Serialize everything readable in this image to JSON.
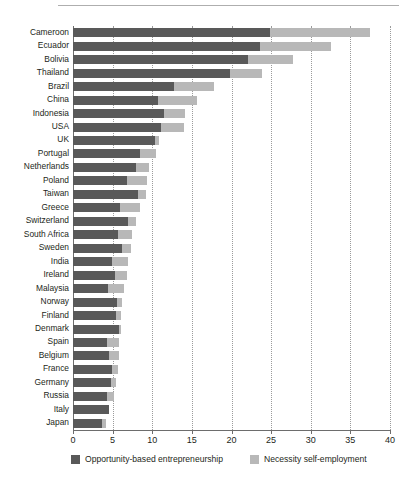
{
  "chart_data": {
    "type": "bar",
    "orientation": "horizontal",
    "stacked": true,
    "title": "",
    "subtitle": "",
    "xlabel": "",
    "ylabel": "",
    "xlim": [
      0,
      40
    ],
    "xticks": [
      0,
      5,
      10,
      15,
      20,
      25,
      30,
      35,
      40
    ],
    "xticklabels": [
      "0",
      "5",
      "10",
      "15",
      "20",
      "25",
      "30",
      "35",
      "40"
    ],
    "grid": "vertical-dotted",
    "legend_position": "bottom",
    "categories": [
      "Cameroon",
      "Ecuador",
      "Bolivia",
      "Thailand",
      "Brazil",
      "China",
      "Indonesia",
      "USA",
      "UK",
      "Portugal",
      "Netherlands",
      "Poland",
      "Taiwan",
      "Greece",
      "Switzerland",
      "South Africa",
      "Sweden",
      "India",
      "Ireland",
      "Malaysia",
      "Norway",
      "Finland",
      "Denmark",
      "Spain",
      "Belgium",
      "France",
      "Germany",
      "Russia",
      "Italy",
      "Japan"
    ],
    "series": [
      {
        "name": "Opportunity-based entrepreneurship",
        "color": "#595959",
        "values": [
          24.9,
          23.6,
          22.1,
          19.8,
          12.8,
          10.7,
          11.5,
          11.1,
          10.3,
          8.5,
          8.0,
          6.8,
          8.2,
          5.9,
          7.0,
          5.7,
          6.2,
          4.9,
          5.3,
          4.4,
          5.6,
          5.4,
          5.8,
          4.3,
          4.6,
          4.9,
          4.8,
          4.3,
          4.5,
          3.6
        ]
      },
      {
        "name": "Necessity self-employment",
        "color": "#b8b8b8",
        "values": [
          12.6,
          9.0,
          5.6,
          4.1,
          5.0,
          4.9,
          2.6,
          2.9,
          0.5,
          2.0,
          1.6,
          2.6,
          1.0,
          2.6,
          0.9,
          1.8,
          1.1,
          2.1,
          1.5,
          2.0,
          0.6,
          0.7,
          0.2,
          1.5,
          1.2,
          0.8,
          0.6,
          0.9,
          0.0,
          0.6
        ]
      }
    ],
    "totals": [
      37.5,
      32.6,
      27.7,
      23.9,
      17.8,
      15.6,
      14.1,
      14.0,
      10.8,
      10.5,
      9.6,
      9.4,
      9.2,
      8.5,
      7.9,
      7.5,
      7.3,
      7.0,
      6.8,
      6.4,
      6.2,
      6.1,
      6.0,
      5.8,
      5.8,
      5.7,
      5.4,
      5.2,
      4.5,
      4.2
    ]
  },
  "legend": {
    "items": [
      {
        "label": "Opportunity-based entrepreneurship",
        "color": "#595959"
      },
      {
        "label": "Necessity self-employment",
        "color": "#b8b8b8"
      }
    ]
  }
}
